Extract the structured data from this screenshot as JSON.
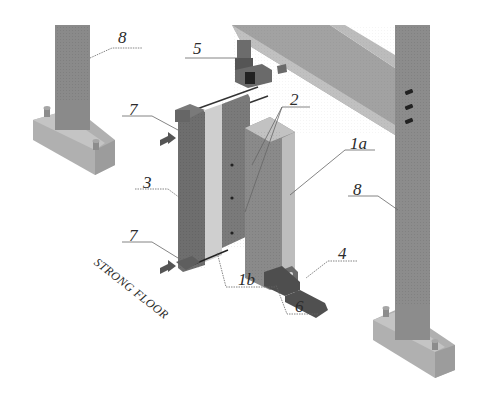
{
  "figure": {
    "type": "isometric test-setup diagram",
    "background": "#ffffff",
    "colors": {
      "column_dark": "#7a7a7a",
      "column_mid": "#8e8e8e",
      "base_light": "#b4b4b4",
      "panel_light": "#c8c8c8",
      "beam": "#9a9a9a",
      "beam_edge": "#c2c2c2",
      "actuator": "#555555",
      "leader_line": "#555555"
    }
  },
  "labels": [
    {
      "id": "8-left",
      "text": "8",
      "x": 118,
      "y": 29
    },
    {
      "id": "5",
      "text": "5",
      "x": 193,
      "y": 40
    },
    {
      "id": "2",
      "text": "2",
      "x": 290,
      "y": 94
    },
    {
      "id": "7-top",
      "text": "7",
      "x": 129,
      "y": 105
    },
    {
      "id": "1a",
      "text": "1a",
      "x": 350,
      "y": 140
    },
    {
      "id": "3",
      "text": "3",
      "x": 143,
      "y": 173
    },
    {
      "id": "8-right",
      "text": "8",
      "x": 353,
      "y": 187
    },
    {
      "id": "4",
      "text": "4",
      "x": 335,
      "y": 243
    },
    {
      "id": "7-bottom",
      "text": "7",
      "x": 129,
      "y": 229
    },
    {
      "id": "1b",
      "text": "1b",
      "x": 238,
      "y": 268
    },
    {
      "id": "6",
      "text": "6",
      "x": 294,
      "y": 295
    }
  ],
  "annotations": {
    "strong_floor": "STRONG FLOOR"
  },
  "legend_meaning": {
    "1a": "front panel",
    "1b": "rear panel",
    "2": "connection",
    "3": "wall column",
    "4": "support foot",
    "5": "actuator",
    "6": "anchor",
    "7": "lateral restraint",
    "8": "reaction frame column"
  }
}
